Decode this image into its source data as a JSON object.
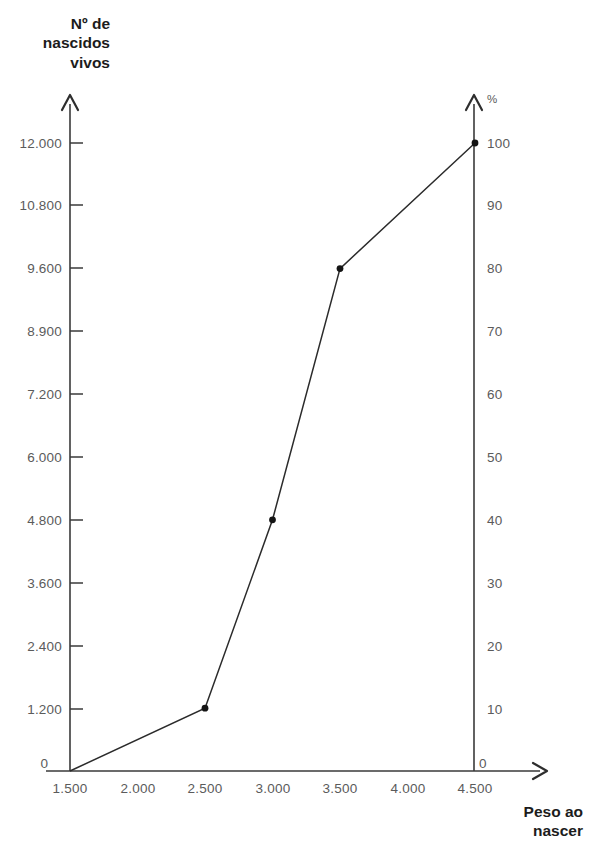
{
  "chart_data": {
    "type": "line",
    "title": "",
    "subtitle": "",
    "xlabel": "Peso ao nascer",
    "ylabel": "Nº de nascidos vivos",
    "y2label": "%",
    "grid": false,
    "legend": null,
    "x": [
      1500,
      2500,
      3000,
      3500,
      4500
    ],
    "values": [
      0,
      1200,
      4800,
      9600,
      12000
    ],
    "percent_values": [
      0,
      10,
      40,
      80,
      100
    ],
    "series": [
      {
        "name": "Nº de nascidos vivos acumulado",
        "x": [
          1500,
          2500,
          3000,
          3500,
          4500
        ],
        "values": [
          0,
          1200,
          4800,
          9600,
          12000
        ],
        "percent": [
          0,
          10,
          40,
          80,
          100
        ],
        "markers": [
          false,
          true,
          true,
          true,
          true
        ]
      }
    ],
    "xlim": [
      1500,
      4500
    ],
    "ylim": [
      0,
      12000
    ],
    "y2lim": [
      0,
      100
    ],
    "xticks": [
      1500,
      2000,
      2500,
      3000,
      3500,
      4000,
      4500
    ],
    "xticklabels": [
      "1.500",
      "2.000",
      "2.500",
      "3.000",
      "3.500",
      "4.000",
      "4.500"
    ],
    "yticks": [
      0,
      1200,
      2400,
      3600,
      4800,
      6000,
      7200,
      8900,
      9600,
      10800,
      12000
    ],
    "yticklabels": [
      "0",
      "1.200",
      "2.400",
      "3.600",
      "4.800",
      "6.000",
      "7.200",
      "8.900",
      "9.600",
      "10.800",
      "12.000"
    ],
    "y2ticks": [
      0,
      10,
      20,
      30,
      40,
      50,
      60,
      70,
      80,
      90,
      100
    ],
    "y2ticklabels": [
      "0",
      "10",
      "20",
      "30",
      "40",
      "50",
      "60",
      "70",
      "80",
      "90",
      "100"
    ]
  },
  "axes": {
    "y_title": "Nº de\nnascidos\nvivos",
    "x_title": "Peso ao\nnascer",
    "right_title": "%",
    "left_origin_label": "0",
    "right_origin_label": "0"
  },
  "colors": {
    "line": "#2b2b2b",
    "axis": "#3a3a3a",
    "tick_text": "#5b5b5b",
    "title_text": "#1c1c1c",
    "background": "#ffffff",
    "marker": "#141414"
  },
  "y_tick_labels": [
    {
      "label": "12.000",
      "value": 12000
    },
    {
      "label": "10.800",
      "value": 10800
    },
    {
      "label": "9.600",
      "value": 9600
    },
    {
      "label": "8.900",
      "value": 8900
    },
    {
      "label": "7.200",
      "value": 7200
    },
    {
      "label": "6.000",
      "value": 6000
    },
    {
      "label": "4.800",
      "value": 4800
    },
    {
      "label": "3.600",
      "value": 3600
    },
    {
      "label": "2.400",
      "value": 2400
    },
    {
      "label": "1.200",
      "value": 1200
    }
  ],
  "x_tick_labels": [
    {
      "label": "1.500",
      "value": 1500
    },
    {
      "label": "2.000",
      "value": 2000
    },
    {
      "label": "2.500",
      "value": 2500
    },
    {
      "label": "3.000",
      "value": 3000
    },
    {
      "label": "3.500",
      "value": 3500
    },
    {
      "label": "4.000",
      "value": 4000
    },
    {
      "label": "4.500",
      "value": 4500
    }
  ],
  "right_tick_labels": [
    {
      "label": "100",
      "value": 100
    },
    {
      "label": "90",
      "value": 90
    },
    {
      "label": "80",
      "value": 80
    },
    {
      "label": "70",
      "value": 70
    },
    {
      "label": "60",
      "value": 60
    },
    {
      "label": "50",
      "value": 50
    },
    {
      "label": "40",
      "value": 40
    },
    {
      "label": "30",
      "value": 30
    },
    {
      "label": "20",
      "value": 20
    },
    {
      "label": "10",
      "value": 10
    }
  ]
}
